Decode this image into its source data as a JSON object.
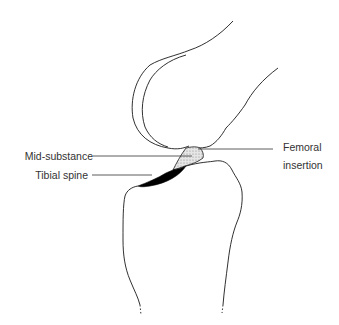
{
  "diagram": {
    "labels": {
      "mid_substance": "Mid-substance",
      "tibial_spine": "Tibial spine",
      "femoral_insertion_line1": "Femoral",
      "femoral_insertion_line2": "insertion"
    },
    "colors": {
      "outline": "#1a1a1a",
      "leader_line": "#333333",
      "ligament_fill": "#d9d9d9",
      "tibial_spine_fill": "#000000",
      "text": "#333333"
    }
  }
}
